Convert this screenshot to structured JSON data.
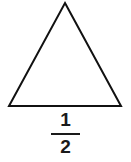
{
  "figure": {
    "background_color": "#ffffff",
    "stroke_color": "#111111",
    "text_color": "#1a1a1a"
  },
  "shape": {
    "name": "triangle",
    "kind": "isosceles-triangle",
    "filled": false,
    "stroke_width": 2,
    "points": "65,3 121,106 9,106",
    "vertices": {
      "apex": [
        65,
        3
      ],
      "bottom_right": [
        121,
        106
      ],
      "bottom_left": [
        9,
        106
      ]
    }
  },
  "label": {
    "type": "fraction",
    "numerator": "1",
    "denominator": "2",
    "value_text": "1/2"
  }
}
